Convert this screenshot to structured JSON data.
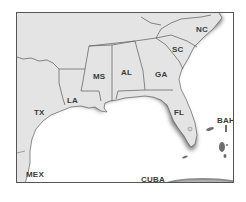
{
  "map": {
    "title": "Southeastern United States",
    "colors": {
      "land": "#e4e4e4",
      "coast_shade": "#8a8a8a",
      "water": "#ffffff",
      "border": "#6a6a6a",
      "frame": "#555555",
      "label": "#3a3a3a"
    },
    "labels": {
      "nc": "NC",
      "sc": "SC",
      "ga": "GA",
      "al": "AL",
      "ms": "MS",
      "la": "LA",
      "tx": "TX",
      "fl": "FL",
      "bah": "BAH",
      "mex": "MEX",
      "cuba": "CUBA"
    }
  }
}
